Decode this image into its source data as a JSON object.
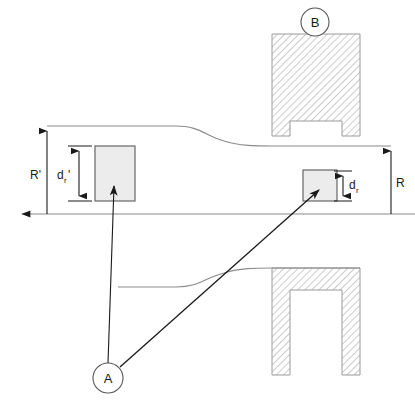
{
  "diagram": {
    "type": "engineering-cross-section",
    "canvas": {
      "width": 415,
      "height": 407
    },
    "colors": {
      "background": "#ffffff",
      "outline": "#8a8a8a",
      "hatch": "#b0b0b0",
      "hatch_border": "#9a9a9a",
      "box_fill": "#ececec",
      "box_stroke": "#666666",
      "dimension": "#1a1a1a",
      "leader": "#1a1a1a",
      "text": "#1a1a1a"
    },
    "dimensions": [
      {
        "id": "R-prime",
        "label": "R'",
        "sublabel": "",
        "side": "left",
        "description": "Outer radius upstream of the contraction",
        "label_x": 34,
        "label_y": 175,
        "line_x": 47,
        "y_top": 126,
        "y_bottom": 214,
        "arrows": "top"
      },
      {
        "id": "d-r-prime",
        "label": "d",
        "sublabel": "r",
        "prime": "'",
        "side": "left",
        "description": "Probe/volume height upstream",
        "label_x": 63,
        "label_y": 179,
        "line_x": 79,
        "y_top": 148,
        "y_bottom": 199,
        "arrows": "both"
      },
      {
        "id": "d-r",
        "label": "d",
        "sublabel": "r",
        "prime": "",
        "side": "right",
        "description": "Probe/volume height downstream",
        "label_x": 350,
        "label_y": 189,
        "line_x": 343,
        "y_top": 172,
        "y_bottom": 200,
        "arrows": "both"
      },
      {
        "id": "R",
        "label": "R",
        "sublabel": "",
        "side": "right",
        "description": "Outer radius downstream of the contraction",
        "label_x": 397,
        "label_y": 187,
        "line_x": 391,
        "y_top": 146,
        "y_bottom": 214,
        "arrows": "top"
      }
    ],
    "callouts": [
      {
        "id": "callout-a",
        "label": "A",
        "cx": 108,
        "cy": 378,
        "r": 15,
        "description": "Measurement volumes / probe locations"
      },
      {
        "id": "callout-b",
        "label": "B",
        "cx": 315,
        "cy": 22,
        "r": 14,
        "description": "Blade / shroud hatched solid body"
      }
    ],
    "boxes": [
      {
        "id": "box-upstream",
        "x": 95,
        "y": 146,
        "width": 40,
        "height": 55,
        "fill": "#ececec"
      },
      {
        "id": "box-downstream",
        "x": 303,
        "y": 170,
        "width": 34,
        "height": 31,
        "fill": "#ececec"
      }
    ],
    "solids": [
      {
        "id": "solid-upper",
        "shape": "u-channel-down",
        "x": 272,
        "y": 34,
        "width": 88,
        "height": 102,
        "wall": 18,
        "description": "Upper hatched shroud section"
      },
      {
        "id": "solid-lower",
        "shape": "u-channel-down",
        "x": 272,
        "y": 268,
        "width": 88,
        "height": 107,
        "wall": 18,
        "description": "Lower hatched shroud section"
      }
    ],
    "axis": {
      "id": "centerline",
      "y": 214,
      "x_start": 13,
      "x_end": 415,
      "arrow": "left",
      "description": "Machine centerline / axis of rotation"
    },
    "profiles": [
      {
        "id": "profile-upper",
        "description": "Upper wall contour contracting from R' to R",
        "path": "M 47 126 L 175 126 C 200 126 205 136 225 141 C 240 145 255 146 272 146 L 391 146"
      },
      {
        "id": "profile-lower",
        "description": "Lower wall contour contracting from R' to R",
        "path": "M 118 287 L 175 287 C 200 287 205 277 225 272 C 240 268 255 268 272 268 L 360 268"
      }
    ],
    "leaders": [
      {
        "id": "leader-a-upstream",
        "from_x": 108,
        "from_y": 363,
        "to_x": 114,
        "to_y": 184,
        "description": "Leader from A to upstream box"
      },
      {
        "id": "leader-a-downstream",
        "from_x": 119,
        "from_y": 370,
        "to_x": 318,
        "to_y": 190,
        "description": "Leader from A to downstream box"
      }
    ]
  }
}
